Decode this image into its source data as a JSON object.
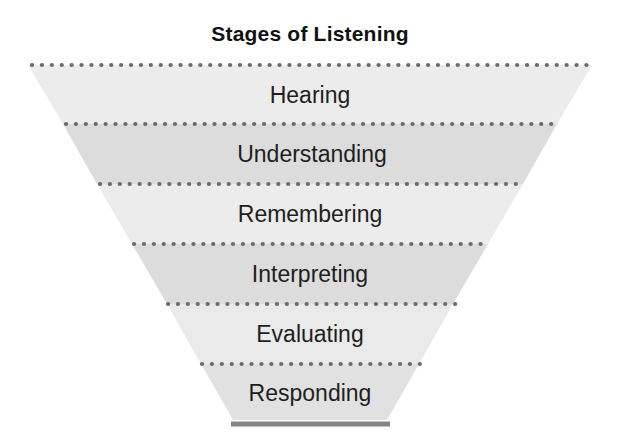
{
  "title": "Stages of Listening",
  "funnel": {
    "stages": [
      {
        "label": "Hearing",
        "fill": "#ececec"
      },
      {
        "label": "Understanding",
        "fill": "#dcdcdc"
      },
      {
        "label": "Remembering",
        "fill": "#ececec"
      },
      {
        "label": "Interpreting",
        "fill": "#dcdcdc"
      },
      {
        "label": "Evaluating",
        "fill": "#eaeaea"
      },
      {
        "label": "Responding",
        "fill": "#e1e1e1"
      }
    ],
    "separator": {
      "style": "dotted",
      "color": "#6b6b6b"
    },
    "base_bar": {
      "color": "#858585"
    },
    "label_color": "#1e1e1e",
    "title_color": "#111111"
  }
}
